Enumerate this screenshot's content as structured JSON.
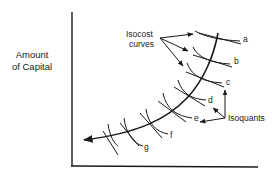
{
  "diagram": {
    "type": "isoquant-isocost expansion path",
    "y_axis_label_line1": "Amount",
    "y_axis_label_line2": "of Capital",
    "x_axis_label": "",
    "annotations": {
      "isocost_line1": "Isocost",
      "isocost_line2": "curves",
      "isoquants": "Isoquants"
    },
    "curve_labels": [
      "a",
      "b",
      "c",
      "d",
      "e",
      "f",
      "g"
    ],
    "colors": {
      "ink": "#1a1a1a",
      "background": "#ffffff"
    }
  }
}
